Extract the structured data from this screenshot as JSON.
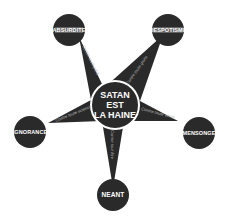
{
  "diagram": {
    "center": {
      "lines": [
        "SATAN",
        "EST",
        "LA HAINE"
      ]
    },
    "nodes": [
      {
        "id": "absurdite",
        "label": "ABSURDITE"
      },
      {
        "id": "despotisme",
        "label": "DESPOTISME"
      },
      {
        "id": "ignorance",
        "label": "IGNORANCE"
      },
      {
        "id": "mensonge",
        "label": "MENSONGE"
      },
      {
        "id": "neant",
        "label": "NEANT"
      }
    ],
    "arms": [
      {
        "to": "absurdite",
        "label": "Contre toute piété"
      },
      {
        "to": "despotisme",
        "label": "Contre toute gloire"
      },
      {
        "to": "ignorance",
        "label": "Contre toute science"
      },
      {
        "to": "mensonge",
        "label": "Contre toute vérité"
      },
      {
        "to": "neant",
        "label": "Contre tout être"
      }
    ],
    "colors": {
      "fill": "#2a2a2a",
      "text": "#ffffff",
      "background": "#ffffff"
    }
  }
}
